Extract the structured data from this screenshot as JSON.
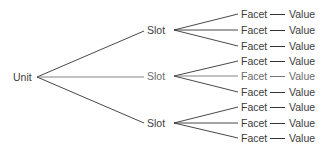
{
  "diagram": {
    "type": "tree",
    "colors": {
      "line": "#333333",
      "text": "#3c3c3c",
      "text_faint": "#6a6a6a"
    },
    "root": {
      "label": "Unit"
    },
    "slots": [
      {
        "label": "Slot",
        "facets": [
          {
            "facet": "Facet",
            "value": "Value"
          },
          {
            "facet": "Facet",
            "value": "Value"
          },
          {
            "facet": "Facet",
            "value": "Value"
          }
        ]
      },
      {
        "label": "Slot",
        "facets": [
          {
            "facet": "Facet",
            "value": "Value"
          },
          {
            "facet": "Facet",
            "value": "Value"
          },
          {
            "facet": "Facet",
            "value": "Value"
          }
        ]
      },
      {
        "label": "Slot",
        "facets": [
          {
            "facet": "Facet",
            "value": "Value"
          },
          {
            "facet": "Facet",
            "value": "Value"
          },
          {
            "facet": "Facet",
            "value": "Value"
          }
        ]
      }
    ]
  }
}
